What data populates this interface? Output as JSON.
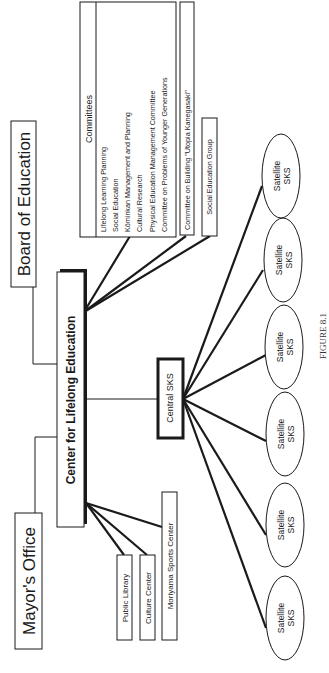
{
  "figure": {
    "caption": "FIGURE 8.1",
    "nodes": {
      "board": "Board of Education",
      "mayor": "Mayor's Office",
      "center": "Center for Lifelong Education",
      "central_sks": "Central SKS",
      "public_library": "Public Library",
      "culture_center": "Culture Center",
      "sports_center": "Moriyama Sports Center",
      "building_committee": "Committee on Building \"Utopia Kanegasaki\"",
      "social_ed_group": "Social Education Group"
    },
    "committees": {
      "title": "Committees",
      "items": [
        "Lifelong Learning Planning",
        "Social Education",
        "Kōminkan Management and Planning",
        "Cultural Research",
        "Physical Education Management Committee",
        "Committee on Problems of Younger Generations"
      ]
    },
    "satellites": [
      {
        "line1": "Satellite",
        "line2": "SKS"
      },
      {
        "line1": "Satellite",
        "line2": "SKS"
      },
      {
        "line1": "Satellite",
        "line2": "SKS"
      },
      {
        "line1": "Satellite",
        "line2": "SKS"
      },
      {
        "line1": "Satellite",
        "line2": "SKS"
      },
      {
        "line1": "Satellite",
        "line2": "SKS"
      }
    ]
  }
}
